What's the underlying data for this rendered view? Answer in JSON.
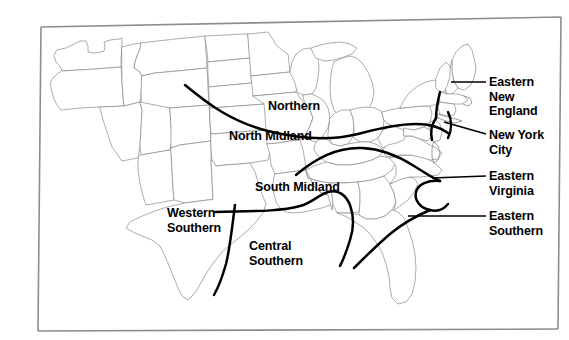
{
  "figure": {
    "type": "map",
    "background_color": "#ffffff",
    "frame_color": "#8d8d90",
    "state_outline_color": "#8a8a8e",
    "boundary_line_color": "#000000",
    "label_color": "#000000"
  },
  "labels": [
    {
      "id": "northern",
      "text": "Northern",
      "placement": "on-map",
      "leader": false
    },
    {
      "id": "north-midland",
      "text": "North Midland",
      "placement": "on-map",
      "leader": false
    },
    {
      "id": "south-midland",
      "text": "South Midland",
      "placement": "on-map",
      "leader": false
    },
    {
      "id": "western-southern",
      "text": "Western\nSouthern",
      "placement": "on-map",
      "leader": false
    },
    {
      "id": "central-southern",
      "text": "Central\nSouthern",
      "placement": "on-map",
      "leader": false
    },
    {
      "id": "eastern-new-england",
      "text": "Eastern\nNew\nEngland",
      "placement": "right-margin",
      "leader": true
    },
    {
      "id": "new-york-city",
      "text": "New York\nCity",
      "placement": "right-margin",
      "leader": true
    },
    {
      "id": "eastern-virginia",
      "text": "Eastern\nVirginia",
      "placement": "right-margin",
      "leader": true
    },
    {
      "id": "eastern-southern",
      "text": "Eastern\nSouthern",
      "placement": "right-margin",
      "leader": true
    }
  ],
  "regions": {
    "northern": "Northern",
    "north_midland": "North Midland",
    "south_midland": "South Midland",
    "western_southern": "Western Southern",
    "central_southern": "Central Southern",
    "eastern_new_england": "Eastern New England",
    "new_york_city": "New York City",
    "eastern_virginia": "Eastern Virginia",
    "eastern_southern": "Eastern Southern"
  }
}
